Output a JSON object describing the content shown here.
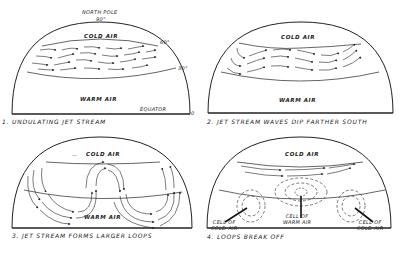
{
  "panels": [
    {
      "caption": "1. UNDULATING JET STREAM",
      "labels": {
        "pole": "NORTH POLE",
        "pole_deg": "90°",
        "cold": "COLD AIR",
        "warm": "WARM AIR",
        "lat60": "60°",
        "lat30": "30°",
        "equator": "EQUATOR",
        "lat0": "0"
      }
    },
    {
      "caption": "2. JET STREAM WAVES DIP FARTHER SOUTH",
      "labels": {
        "cold": "COLD AIR",
        "warm": "WARM AIR"
      }
    },
    {
      "caption": "3. JET STREAM FORMS LARGER LOOPS",
      "labels": {
        "cold": "COLD AIR",
        "warm": "WARM AIR"
      }
    },
    {
      "caption": "4. LOOPS BREAK OFF",
      "labels": {
        "cold": "COLD AIR",
        "cell_cold_left_1": "CELL OF",
        "cell_cold_left_2": "COLD AIR",
        "cell_warm_1": "CELL OF",
        "cell_warm_2": "WARM AIR",
        "cell_cold_right_1": "CELL OF",
        "cell_cold_right_2": "COLD AIR"
      }
    }
  ],
  "colors": {
    "ink": "#222222",
    "paper": "#ffffff"
  }
}
